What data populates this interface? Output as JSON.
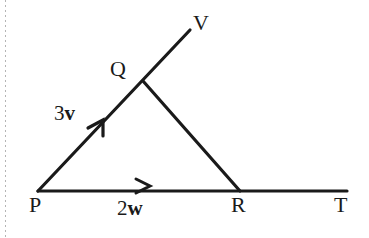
{
  "figure": {
    "background_color": "#ffffff",
    "stroke_color": "#1a1a1a",
    "labels": {
      "P": "P",
      "Q": "Q",
      "R": "R",
      "T": "T",
      "V": "V"
    },
    "vectors": [
      {
        "name": "vector-3v",
        "scalar": "3",
        "symbol": "v",
        "on_segment": "PQ",
        "arrow_direction": "toward Q"
      },
      {
        "name": "vector-2w",
        "scalar": "2",
        "symbol": "w",
        "on_segment": "PR",
        "arrow_direction": "toward R"
      }
    ],
    "points": {
      "P": {
        "x": 38,
        "y": 191
      },
      "Q": {
        "x": 143,
        "y": 81
      },
      "R": {
        "x": 240,
        "y": 191
      },
      "T": {
        "x": 347,
        "y": 191
      },
      "V": {
        "x": 190,
        "y": 30
      }
    },
    "segments": [
      {
        "name": "segment-P-to-V",
        "from": "P",
        "to": "V",
        "note": "ray through Q continuing to V"
      },
      {
        "name": "segment-P-to-T",
        "from": "P",
        "to": "T",
        "note": "ray through R continuing to T"
      },
      {
        "name": "segment-Q-to-R",
        "from": "Q",
        "to": "R",
        "note": "triangle side"
      }
    ],
    "arrow_markers": [
      {
        "name": "arrowhead-3v",
        "x": 98,
        "y": 125,
        "style": "half-barb",
        "along": "PQ"
      },
      {
        "name": "arrowhead-2w",
        "x": 144,
        "y": 186,
        "style": "chevron",
        "along": "PR"
      }
    ]
  }
}
